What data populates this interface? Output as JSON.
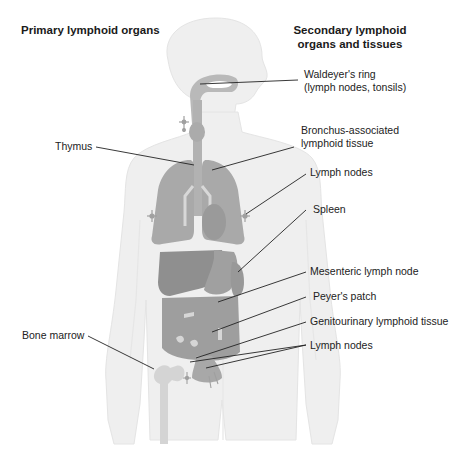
{
  "headers": {
    "primary": "Primary lymphoid organs",
    "secondary_line1": "Secondary lymphoid",
    "secondary_line2": "organs and tissues"
  },
  "labels_left": {
    "thymus": "Thymus",
    "bone_marrow": "Bone marrow"
  },
  "labels_right": {
    "waldeyer_line1": "Waldeyer's ring",
    "waldeyer_line2": "(lymph nodes, tonsils)",
    "bronchus_line1": "Bronchus-associated",
    "bronchus_line2": "lymphoid tissue",
    "lymph_nodes_axillary": "Lymph nodes",
    "spleen": "Spleen",
    "mesenteric": "Mesenteric lymph node",
    "peyers": "Peyer's patch",
    "genitourinary": "Genitourinary lymphoid tissue",
    "lymph_nodes_inguinal": "Lymph nodes"
  },
  "colors": {
    "body_silhouette": "#efefef",
    "body_outline": "#e2e2e2",
    "organ_light": "#b9b9b9",
    "organ_mid": "#a5a5a5",
    "organ_dark": "#8f8f8f",
    "bone": "#d3d3d3",
    "leader_line": "#222222"
  }
}
